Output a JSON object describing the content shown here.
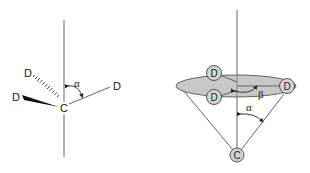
{
  "left_diagram": {
    "center_atom": "C",
    "substituents": [
      {
        "label": "D",
        "bond": "hashed-wedge",
        "position": "upper-left"
      },
      {
        "label": "D",
        "bond": "solid-wedge",
        "position": "left"
      },
      {
        "label": "D",
        "bond": "plain",
        "position": "right"
      }
    ],
    "angle_label": "α",
    "axis": "vertical"
  },
  "right_diagram": {
    "apex_atom": "C",
    "ring_atoms": [
      {
        "label": "D",
        "position": "back-left"
      },
      {
        "label": "D",
        "position": "front-left"
      },
      {
        "label": "D",
        "position": "right"
      }
    ],
    "cone_angle_label": "α",
    "rotation_angle_label": "β",
    "axis": "vertical",
    "disk_color": "#c8c8c8",
    "atom_fill": "#d4d4d4"
  },
  "colors": {
    "line": "#555555",
    "text": "#222222",
    "background": "#ffffff"
  }
}
